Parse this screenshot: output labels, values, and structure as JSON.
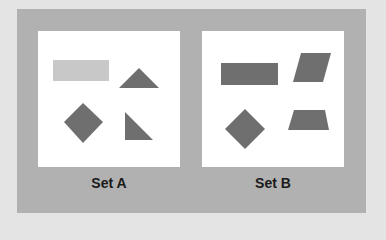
{
  "figure": {
    "colors": {
      "background": "#e4e4e4",
      "frame": "#b1b1b1",
      "panel": "#ffffff",
      "shape_dark": "#6f6f6f",
      "shape_light": "#c8c8c8"
    },
    "sets": [
      {
        "label": "Set A",
        "shapes": [
          {
            "type": "rectangle",
            "shade": "light"
          },
          {
            "type": "triangle",
            "shade": "dark"
          },
          {
            "type": "diamond",
            "shade": "dark"
          },
          {
            "type": "right-triangle",
            "shade": "dark"
          }
        ]
      },
      {
        "label": "Set B",
        "shapes": [
          {
            "type": "rectangle",
            "shade": "dark"
          },
          {
            "type": "parallelogram",
            "shade": "dark"
          },
          {
            "type": "diamond",
            "shade": "dark"
          },
          {
            "type": "trapezoid",
            "shade": "dark"
          }
        ]
      }
    ]
  }
}
